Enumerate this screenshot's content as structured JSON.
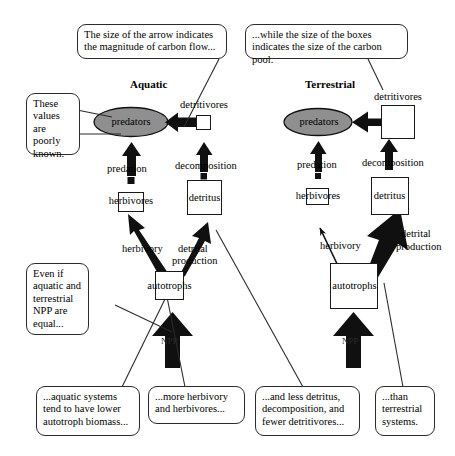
{
  "figure": {
    "title_aquatic": "Aquatic",
    "title_terrestrial": "Terrestrial",
    "accent_fill": "#8f8f8f",
    "line_color": "#1a1a1a",
    "background": "#ffffff"
  },
  "callouts": {
    "arrow_size": "The size of the arrow indicates the magnitude of carbon flow...",
    "box_size": "...while the size of the boxes indicates the size of the carbon pool.",
    "poorly_known": "These values are poorly known.",
    "npp_equal": "Even if aquatic and terrestrial NPP are equal...",
    "lower_autotroph": "...aquatic systems tend to have lower autotroph biomass...",
    "more_herbivory": "...more herbivory and herbivores...",
    "less_detritus": "...and less detritus, decomposition, and fewer detritivores...",
    "than_terrestrial": "...than terrestrial systems."
  },
  "aquatic": {
    "predators": "predators",
    "herbivores": "herbivores",
    "autotrophs": "autotrophs",
    "detritivores": "detritivores",
    "detritus": "detritus",
    "predation": "predation",
    "herbivory": "herbivory",
    "decomposition": "decomposition",
    "detrital_production": "detrital\nproduction",
    "detrital_production_line1": "detrital",
    "detrital_production_line2": "production",
    "npp": "NPP"
  },
  "terrestrial": {
    "predators": "predators",
    "herbivores": "herbivores",
    "autotrophs": "autotrophs",
    "detritivores": "detritivores",
    "detritus": "detritus",
    "predation": "predation",
    "herbivory": "herbivory",
    "decomposition": "decomposition",
    "detrital_production_line1": "detrital",
    "detrital_production_line2": "production",
    "npp": "NPP"
  }
}
